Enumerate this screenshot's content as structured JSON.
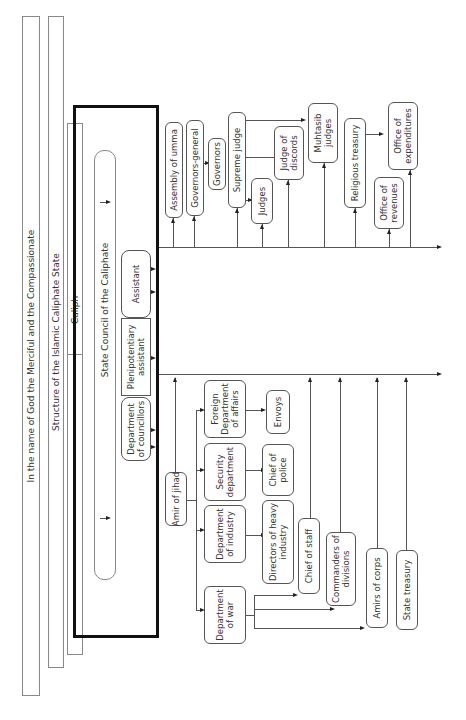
{
  "header": {
    "invocation": "In the name of God the Merciful and the Compassionate",
    "title": "Structure of the Islamic Caliphate State"
  },
  "top": {
    "caliph": "Caliph",
    "state_council": "State Council of the Caliphate",
    "department_of_councillors": "Department of councillors",
    "plenipotentiary_assistant": "Plenipotentiary assistant",
    "assistant": "Assistant"
  },
  "upper_branch": {
    "assembly_of_umma": "Assembly of umma",
    "governors_general": "Governors-general",
    "governors": "Governors",
    "supreme_judge": "Supreme judge",
    "judges": "Judges",
    "judge_of_discords": "Judge of discords",
    "muhtasib_judges": "Muhtasib judges",
    "religious_treasury": "Religious treasury",
    "office_of_revenues": "Office of revenues",
    "office_of_expenditures": "Office of expenditures"
  },
  "lower_branch": {
    "amir_of_jihad": "Amir of jihad",
    "department_of_war": "Department of war",
    "department_of_industry": "Department of industry",
    "security_department": "Security department",
    "foreign_affairs": "Foreign Department of affairs",
    "directors_of_heavy_industry": "Directors of heavy industry",
    "chief_of_police": "Chief of police",
    "envoys": "Envoys",
    "chief_of_staff": "Chief of staff",
    "commanders_of_divisions": "Commanders of divisions",
    "amirs_of_corps": "Amirs of corps",
    "state_treasury": "State treasury"
  }
}
